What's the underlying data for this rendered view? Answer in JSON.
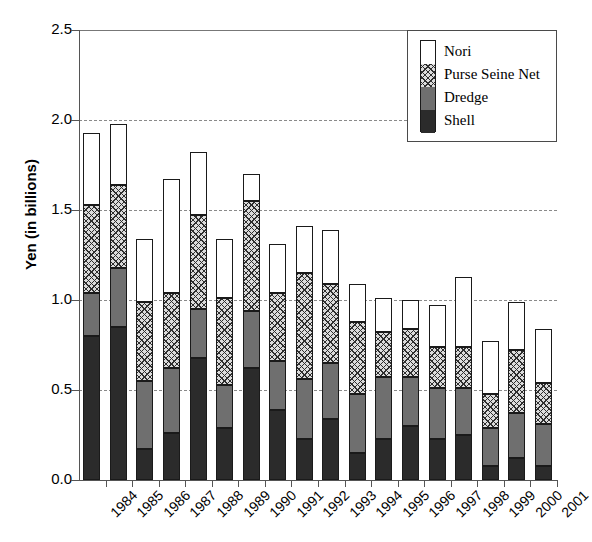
{
  "chart_data": {
    "type": "bar",
    "subtype": "stacked-vertical",
    "title": "",
    "xlabel": "",
    "ylabel": "Yen (in billions)",
    "ylim": [
      0.0,
      2.5
    ],
    "yticks": [
      "0.0",
      "0.5",
      "1.0",
      "1.5",
      "2.0",
      "2.5"
    ],
    "ytick_values": [
      0.0,
      0.5,
      1.0,
      1.5,
      2.0,
      2.5
    ],
    "grid": "horizontal-dashed",
    "legend_position": "top-right",
    "categories": [
      "1984",
      "1985",
      "1986",
      "1987",
      "1988",
      "1989",
      "1990",
      "1991",
      "1992",
      "1993",
      "1994",
      "1995",
      "1996",
      "1997",
      "1998",
      "1999",
      "2000",
      "2001"
    ],
    "series": [
      {
        "name": "Shell",
        "color": "#2b2b2b",
        "pattern": "solid-dark",
        "values": [
          0.8,
          0.85,
          0.17,
          0.26,
          0.68,
          0.29,
          0.62,
          0.39,
          0.23,
          0.34,
          0.15,
          0.23,
          0.3,
          0.23,
          0.25,
          0.08,
          0.12,
          0.08
        ]
      },
      {
        "name": "Dredge",
        "color": "#6f6f6f",
        "pattern": "solid-gray",
        "values": [
          0.24,
          0.33,
          0.38,
          0.36,
          0.27,
          0.24,
          0.32,
          0.27,
          0.33,
          0.31,
          0.33,
          0.34,
          0.27,
          0.28,
          0.26,
          0.21,
          0.25,
          0.23
        ]
      },
      {
        "name": "Purse Seine Net",
        "color": "#dcdcdc",
        "pattern": "crosshatch",
        "values": [
          0.49,
          0.46,
          0.44,
          0.42,
          0.52,
          0.48,
          0.61,
          0.38,
          0.59,
          0.44,
          0.4,
          0.25,
          0.27,
          0.23,
          0.23,
          0.19,
          0.35,
          0.23
        ]
      },
      {
        "name": "Nori",
        "color": "#ffffff",
        "pattern": "empty-white",
        "values": [
          0.4,
          0.34,
          0.35,
          0.63,
          0.35,
          0.33,
          0.15,
          0.27,
          0.26,
          0.3,
          0.21,
          0.19,
          0.16,
          0.23,
          0.39,
          0.29,
          0.27,
          0.3
        ]
      }
    ],
    "totals": [
      1.93,
      1.98,
      1.34,
      1.67,
      1.82,
      1.34,
      1.7,
      1.31,
      1.41,
      1.39,
      1.09,
      1.01,
      1.0,
      0.97,
      1.13,
      0.77,
      0.99,
      0.84
    ]
  },
  "legend": {
    "items": [
      {
        "label": "Nori"
      },
      {
        "label": "Purse Seine Net"
      },
      {
        "label": "Dredge"
      },
      {
        "label": "Shell"
      }
    ]
  }
}
